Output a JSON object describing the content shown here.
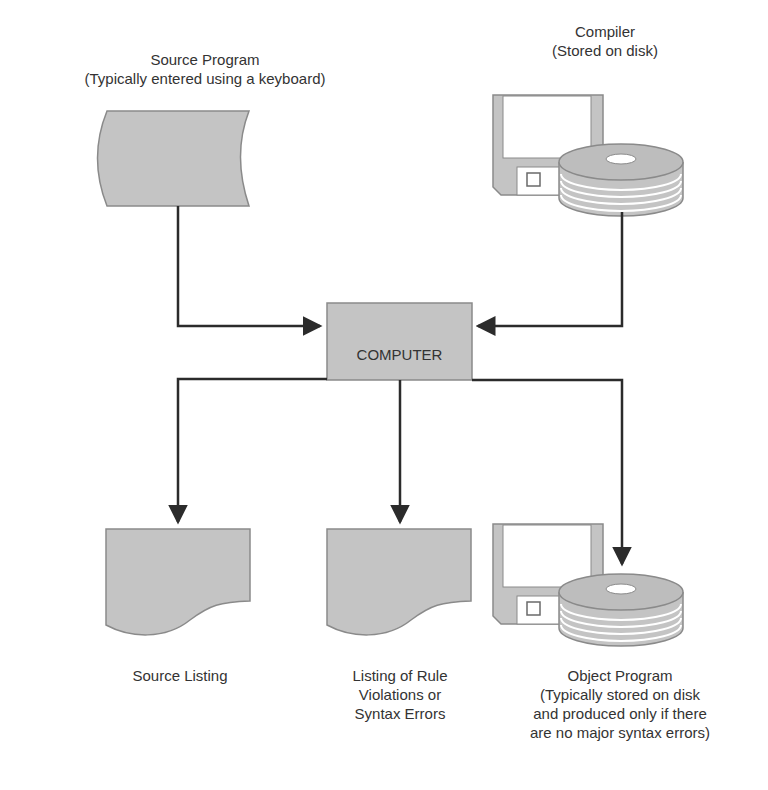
{
  "diagram": {
    "colors": {
      "fill": "#c4c4c4",
      "stroke": "#8a8a8a",
      "arrow": "#2b2b2b",
      "background": "#ffffff"
    },
    "nodes": {
      "source_program": {
        "shape": "punched-tape / keyboard input",
        "title": "Source Program",
        "subtitle": "(Typically entered using a keyboard)"
      },
      "compiler": {
        "shape": "floppy disk + disk pack",
        "title": "Compiler",
        "subtitle": "(Stored on disk)"
      },
      "computer": {
        "shape": "process box",
        "label": "COMPUTER"
      },
      "source_listing": {
        "shape": "document",
        "label": "Source Listing"
      },
      "rule_violations": {
        "shape": "document",
        "line1": "Listing of Rule",
        "line2": "Violations or",
        "line3": "Syntax Errors"
      },
      "object_program": {
        "shape": "floppy disk + disk pack",
        "title": "Object Program",
        "line2": "(Typically stored on disk",
        "line3": "and produced only if there",
        "line4": "are no major syntax errors)"
      }
    },
    "edges": [
      {
        "from": "Source Program",
        "to": "COMPUTER"
      },
      {
        "from": "Compiler",
        "to": "COMPUTER"
      },
      {
        "from": "COMPUTER",
        "to": "Source Listing"
      },
      {
        "from": "COMPUTER",
        "to": "Listing of Rule Violations or Syntax Errors"
      },
      {
        "from": "COMPUTER",
        "to": "Object Program"
      }
    ]
  }
}
